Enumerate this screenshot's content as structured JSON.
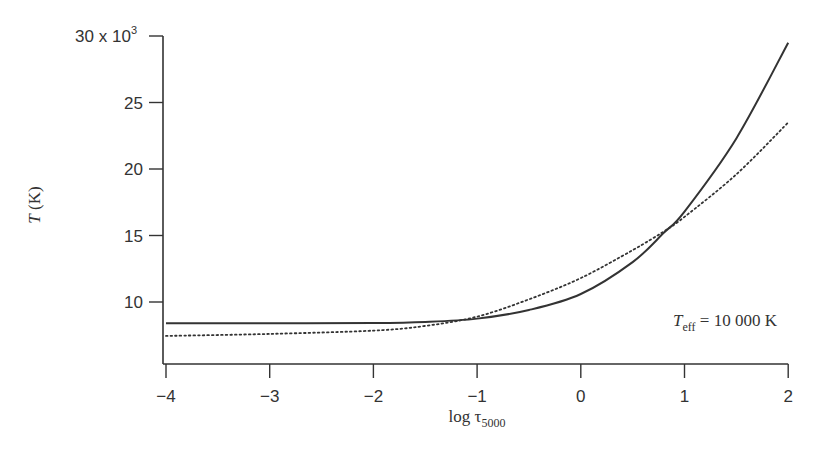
{
  "chart_data": {
    "type": "line",
    "title": "",
    "xlabel": "log τ5000",
    "xlabel_main": "log τ",
    "xlabel_sub": "5000",
    "ylabel": "T (K)",
    "ylabel_italic": "T",
    "ylabel_unit": "(K)",
    "xlim": [
      -4,
      2
    ],
    "ylim_display": [
      6.9,
      30
    ],
    "y_multiplier": "x 10",
    "y_multiplier_exp": "3",
    "xticks": [
      -4,
      -3,
      -2,
      -1,
      0,
      1,
      2
    ],
    "xtick_labels": [
      "−4",
      "−3",
      "−2",
      "−1",
      "0",
      "1",
      "2"
    ],
    "yticks": [
      10,
      15,
      20,
      25,
      30
    ],
    "ytick_labels": [
      "10",
      "15",
      "20",
      "25",
      "30 x 10"
    ],
    "grid": false,
    "annotation": {
      "main": "T",
      "sub": "eff",
      "rest": " = 10 000 K",
      "x": 1.0,
      "y": 8.6
    },
    "series": [
      {
        "name": "solid",
        "style": "solid",
        "x": [
          -4,
          -3,
          -2,
          -1.5,
          -1.0,
          -0.5,
          0.0,
          0.5,
          0.8,
          1.0,
          1.5,
          2.0
        ],
        "y": [
          8.4,
          8.4,
          8.42,
          8.5,
          8.75,
          9.4,
          10.6,
          13.0,
          15.2,
          16.8,
          22.3,
          29.5
        ]
      },
      {
        "name": "dotted",
        "style": "dotted",
        "x": [
          -4,
          -3,
          -2,
          -1.5,
          -1.0,
          -0.5,
          0.0,
          0.5,
          0.8,
          1.0,
          1.5,
          2.0
        ],
        "y": [
          7.45,
          7.6,
          7.85,
          8.2,
          8.9,
          10.2,
          11.8,
          13.9,
          15.3,
          16.4,
          19.6,
          23.5
        ]
      }
    ]
  }
}
